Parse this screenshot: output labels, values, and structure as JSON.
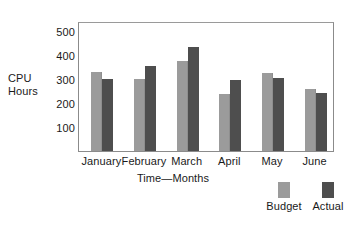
{
  "chart_data": {
    "type": "bar",
    "title": "",
    "xlabel": "Time—Months",
    "ylabel": "CPU Hours",
    "ylabel_lines": [
      "CPU",
      "Hours"
    ],
    "categories": [
      "January",
      "February",
      "March",
      "April",
      "May",
      "June"
    ],
    "series": [
      {
        "name": "Budget",
        "color": "#9b9b9b",
        "values": [
          330,
          300,
          372,
          238,
          322,
          258
        ]
      },
      {
        "name": "Actual",
        "color": "#4e4e4e",
        "values": [
          300,
          355,
          432,
          295,
          303,
          242
        ]
      }
    ],
    "yticks": [
      100,
      200,
      300,
      400,
      500
    ],
    "ylim": [
      0,
      540
    ],
    "grid": false,
    "legend_position": "bottom-right",
    "legend": [
      "Budget",
      "Actual"
    ]
  },
  "colors": {
    "budget": "#9b9b9b",
    "actual": "#4e4e4e",
    "frame": "#8b8b8b",
    "background": "#ffffff",
    "text": "#1a1a1a"
  }
}
